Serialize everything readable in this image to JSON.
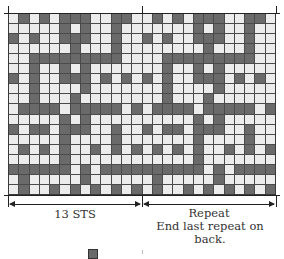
{
  "chart_data": {
    "type": "table",
    "columns": 26,
    "rows": 18,
    "repeat_width": 13,
    "colors": {
      "dark": "#6a6a6a",
      "light": "#ececec",
      "grid": "#4a4a4a"
    },
    "legend": "D = dark (contrast color), W = light (main color)",
    "pattern_13": [
      "WDWDWDDDWWDDW",
      "WWWWWDWDWWDWW",
      "DWDWWDDDWWDWW",
      "WWWWWWDWWWDWW",
      "WWDDDDDDDDDWW",
      "WWDWWDWDWWWWW",
      "DWDWWDDDWDWDW",
      "WWDWWWWDWWWWW",
      "WWDWWWDWWWWWW",
      "WDDDDWDDDDDWD",
      "WWWWWDWDWWWWW",
      "DWDDWDDDWWDWW",
      "WWWWWDWWWWDWW",
      "WDWDWDWWDWDWD",
      "WWWWWDWWWWWWW",
      "DDDDDDWDWDDDD",
      "WDWWWWWDWWWWW",
      "WDWWDWDWDWDWD"
    ]
  },
  "labels": {
    "left_span": "13 STS",
    "right_span_line1": "Repeat",
    "right_span_line2": "End last repeat on back."
  },
  "legend": {
    "swatch": "dark-square"
  }
}
